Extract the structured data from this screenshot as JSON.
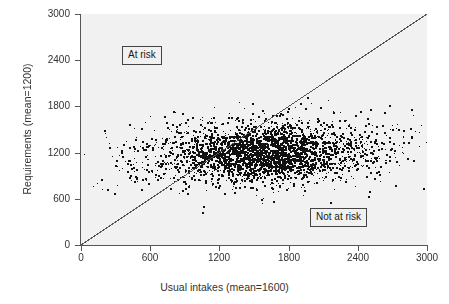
{
  "chart_data": {
    "type": "scatter",
    "title": "",
    "xlabel": "Usual intakes (mean=1600)",
    "ylabel": "Requirements (mean=1200)",
    "xlim": [
      0,
      3000
    ],
    "ylim": [
      0,
      3000
    ],
    "xticks": [
      0,
      600,
      1200,
      1800,
      2400,
      3000
    ],
    "yticks": [
      0,
      600,
      1200,
      1800,
      2400,
      3000
    ],
    "xtick_labels": [
      "0",
      "600",
      "1200",
      "1800",
      "2400",
      "3000"
    ],
    "ytick_labels": [
      "0",
      "600",
      "1200",
      "1800",
      "2400",
      "3000"
    ],
    "grid": false,
    "legend": false,
    "plot_background": "#f1f1f1",
    "point_color": "#111111",
    "point_marker": "square",
    "point_size_px": 2,
    "n_points": 2600,
    "series": [
      {
        "name": "Individuals",
        "description": "Usual intake (x) vs requirement (y), bivariate cloud centered near x=1600, y=1200",
        "x_mean": 1600,
        "y_mean": 1200,
        "x_sd": 520,
        "y_sd": 210,
        "correlation": 0.12
      }
    ],
    "reference_line": {
      "name": "identity-line",
      "equation": "y = x",
      "from": [
        0,
        0
      ],
      "to": [
        3000,
        3000
      ],
      "color": "#555555"
    },
    "annotations": [
      {
        "name": "at-risk",
        "label": "At risk",
        "region": "above identity line"
      },
      {
        "name": "not-at-risk",
        "label": "Not at risk",
        "region": "below identity line"
      }
    ]
  },
  "figure": {
    "axis_color": "#555555",
    "background": "#ffffff"
  }
}
